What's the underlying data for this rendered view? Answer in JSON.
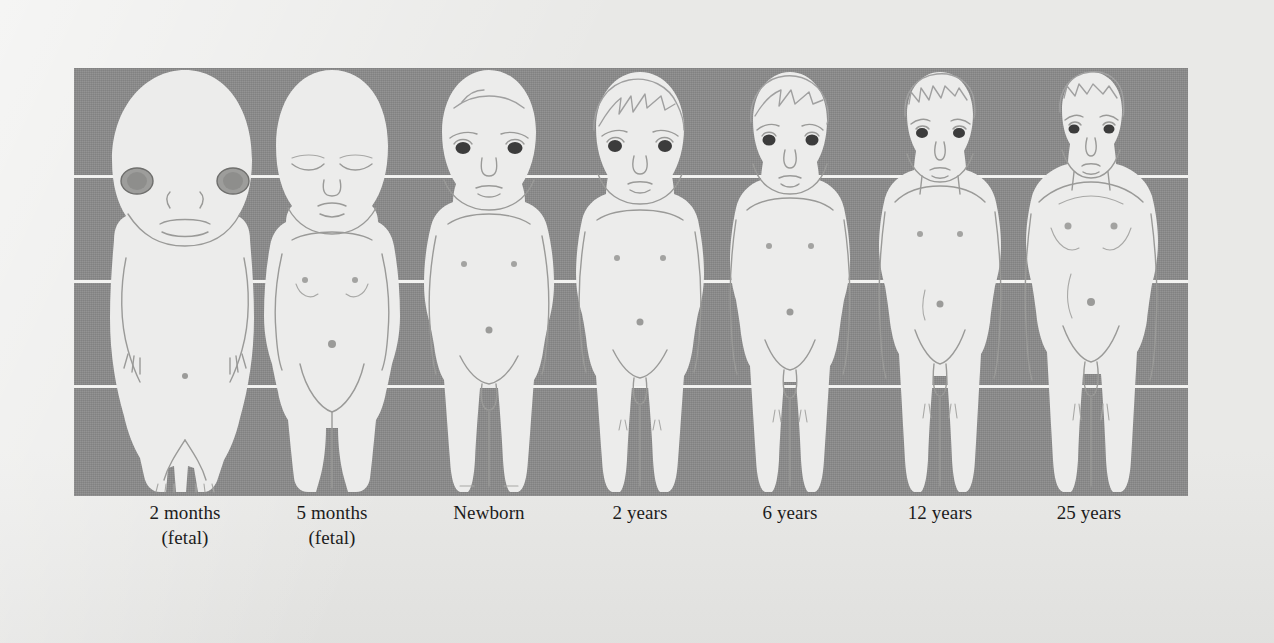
{
  "figure": {
    "panel": {
      "background_color": "#8a8a8a",
      "figure_color": "#ececeb",
      "gridline_color": "#f2f2f0",
      "gridline_count": 3,
      "gridline_positions_pct": [
        25,
        49.5,
        74
      ]
    },
    "page_background_color": "#e9e9e7"
  },
  "stages": [
    {
      "id": "fetal-2-months",
      "label": "2 months",
      "sublabel": "(fetal)",
      "center_x": 185,
      "width": 190,
      "head_fraction": "1/2",
      "hair": "none",
      "eyes": "large-dark-prominent",
      "notes": "enormous cranium, tiny limbs, webbed fingers and toes"
    },
    {
      "id": "fetal-5-months",
      "label": "5 months",
      "sublabel": "(fetal)",
      "center_x": 332,
      "width": 160,
      "head_fraction": "1/3",
      "hair": "none",
      "eyes": "closed",
      "notes": "large head, rounded abdomen, short legs"
    },
    {
      "id": "newborn",
      "label": "Newborn",
      "sublabel": "",
      "center_x": 489,
      "width": 150,
      "head_fraction": "1/4",
      "hair": "sparse",
      "eyes": "open-dark",
      "notes": "head about one quarter of total body length"
    },
    {
      "id": "age-2-years",
      "label": "2 years",
      "sublabel": "",
      "center_x": 640,
      "width": 150,
      "head_fraction": "1/5",
      "hair": "tousled",
      "eyes": "open-dark",
      "notes": "toddler proportions, rounded belly"
    },
    {
      "id": "age-6-years",
      "label": "6 years",
      "sublabel": "",
      "center_x": 790,
      "width": 146,
      "head_fraction": "1/6",
      "hair": "swept",
      "eyes": "open-dark",
      "notes": "limbs lengthening relative to trunk"
    },
    {
      "id": "age-12-years",
      "label": "12 years",
      "sublabel": "",
      "center_x": 940,
      "width": 146,
      "head_fraction": "1/7",
      "hair": "short-spiky",
      "eyes": "open-dark",
      "notes": "pre-adolescent, slim build"
    },
    {
      "id": "age-25-years",
      "label": "25 years",
      "sublabel": "",
      "center_x": 1089,
      "width": 150,
      "head_fraction": "1/8",
      "hair": "short",
      "eyes": "open-dark",
      "notes": "adult proportions, broad shoulders"
    }
  ]
}
